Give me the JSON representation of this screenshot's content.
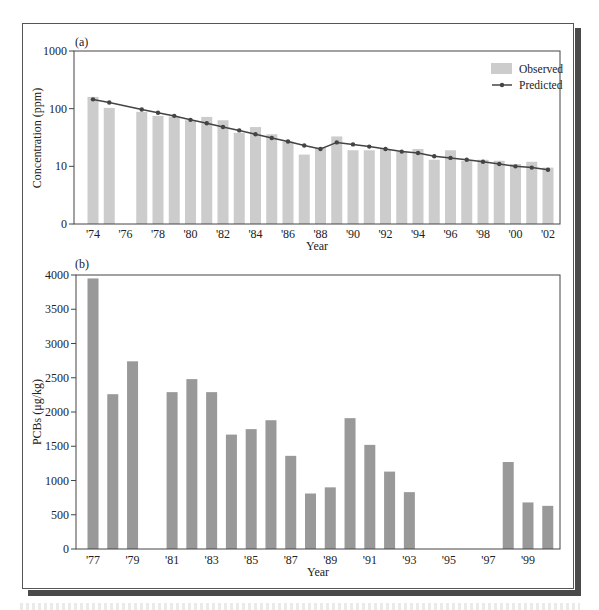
{
  "chart_data": [
    {
      "panel": "(a)",
      "type": "bar",
      "ylabel": "Concentration (ppm)",
      "xlabel": "Year",
      "yscale": "log",
      "ylim": [
        1,
        1000
      ],
      "yticks": [
        {
          "value": 1,
          "label": "0"
        },
        {
          "value": 10,
          "label": "10"
        },
        {
          "value": 100,
          "label": "100"
        },
        {
          "value": 1000,
          "label": "1000"
        }
      ],
      "xtick_labels": [
        "'74",
        "'76",
        "'78",
        "'80",
        "'82",
        "'84",
        "'86",
        "'88",
        "'90",
        "'92",
        "'94",
        "'96",
        "'98",
        "'00",
        "'02"
      ],
      "legend": {
        "position": "upper right",
        "entries": [
          "Observed",
          "Predicted"
        ]
      },
      "grid": false,
      "categories": [
        1974,
        1975,
        1976,
        1977,
        1978,
        1979,
        1980,
        1981,
        1982,
        1983,
        1984,
        1985,
        1986,
        1987,
        1988,
        1989,
        1990,
        1991,
        1992,
        1993,
        1994,
        1995,
        1996,
        1997,
        1998,
        1999,
        2000,
        2001,
        2002
      ],
      "series": [
        {
          "name": "Observed",
          "type": "bar",
          "color": "#cccccc",
          "values": [
            160,
            103,
            null,
            88,
            75,
            73,
            63,
            72,
            63,
            38,
            48,
            36,
            27,
            16,
            21,
            33,
            19,
            19,
            20,
            18,
            20,
            13,
            19,
            12.5,
            13,
            12.5,
            11,
            12,
            9.5
          ]
        },
        {
          "name": "Predicted",
          "type": "line",
          "color": "#444444",
          "values": [
            145,
            128,
            null,
            97,
            85,
            75,
            64,
            56,
            48,
            42,
            36,
            31,
            27,
            23,
            20,
            26,
            24,
            22,
            20,
            18,
            17,
            15,
            14,
            13,
            12,
            11,
            10,
            9.5,
            8.7
          ]
        }
      ]
    },
    {
      "panel": "(b)",
      "type": "bar",
      "ylabel": "PCBs (μg/kg)",
      "xlabel": "Year",
      "ylim": [
        0,
        4000
      ],
      "yticks": [
        0,
        500,
        1000,
        1500,
        2000,
        2500,
        3000,
        3500,
        4000
      ],
      "xtick_labels": [
        "'77",
        "'79",
        "'81",
        "'83",
        "'85",
        "'87",
        "'89",
        "'91",
        "'93",
        "'95",
        "'97",
        "'99"
      ],
      "grid": false,
      "categories": [
        1977,
        1978,
        1979,
        1980,
        1981,
        1982,
        1983,
        1984,
        1985,
        1986,
        1987,
        1988,
        1989,
        1990,
        1991,
        1992,
        1993,
        1994,
        1995,
        1996,
        1997,
        1998,
        1999,
        2000
      ],
      "series": [
        {
          "name": "PCBs",
          "color": "#999999",
          "values": [
            3950,
            2260,
            2740,
            null,
            2290,
            2480,
            2290,
            1670,
            1750,
            1880,
            1360,
            810,
            900,
            1910,
            1520,
            1130,
            830,
            null,
            null,
            null,
            null,
            1270,
            680,
            630
          ]
        }
      ]
    }
  ],
  "labels": {
    "panel_a": "(a)",
    "panel_b": "(b)",
    "a_ylabel": "Concentration (ppm)",
    "a_xlabel": "Year",
    "b_ylabel": "PCBs (μg/kg)",
    "b_xlabel": "Year",
    "legend_observed": "Observed",
    "legend_predicted": "Predicted"
  }
}
